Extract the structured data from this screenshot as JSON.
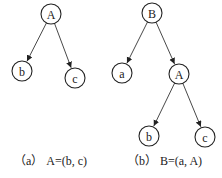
{
  "figures": [
    {
      "id": "a",
      "caption": "（a） A=(b, c)",
      "nodes": [
        {
          "label": "A",
          "x": 51,
          "y": 14
        },
        {
          "label": "b",
          "x": 22,
          "y": 71
        },
        {
          "label": "c",
          "x": 75,
          "y": 78
        }
      ],
      "edges": [
        [
          "A",
          "b"
        ],
        [
          "A",
          "c"
        ]
      ]
    },
    {
      "id": "b",
      "caption": "（b） B=(a, A)",
      "nodes": [
        {
          "label": "B",
          "x": 152,
          "y": 13
        },
        {
          "label": "a",
          "x": 122,
          "y": 73
        },
        {
          "label": "A",
          "x": 179,
          "y": 74
        },
        {
          "label": "b",
          "x": 149,
          "y": 136
        },
        {
          "label": "c",
          "x": 205,
          "y": 137
        }
      ],
      "edges": [
        [
          "B",
          "a"
        ],
        [
          "B",
          "A"
        ],
        [
          "A",
          "b"
        ],
        [
          "A",
          "c"
        ]
      ]
    }
  ],
  "node_radius": 10
}
